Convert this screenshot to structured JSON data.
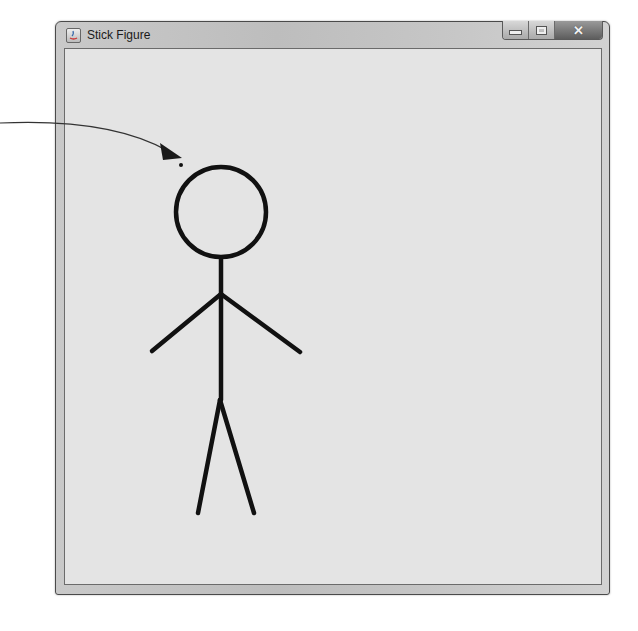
{
  "window": {
    "title": "Stick Figure",
    "buttons": {
      "minimize": "minimize",
      "maximize": "maximize",
      "close": "✕"
    }
  },
  "canvas": {
    "background": "#e4e4e4",
    "stroke": "#111111",
    "figure": {
      "head": {
        "cx": 221,
        "cy": 212,
        "r": 45
      },
      "neck_body": {
        "x1": 221,
        "y1": 258,
        "x2": 221,
        "y2": 400
      },
      "left_arm": {
        "x1": 221,
        "y1": 294,
        "x2": 152,
        "y2": 351
      },
      "right_arm": {
        "x1": 221,
        "y1": 294,
        "x2": 300,
        "y2": 352
      },
      "left_leg": {
        "x1": 220,
        "y1": 400,
        "x2": 198,
        "y2": 513
      },
      "right_leg": {
        "x1": 220,
        "y1": 400,
        "x2": 254,
        "y2": 513
      }
    }
  },
  "annotation": {
    "arrow_color": "#222222",
    "pointer_dot": {
      "x": 181,
      "y": 165
    }
  }
}
